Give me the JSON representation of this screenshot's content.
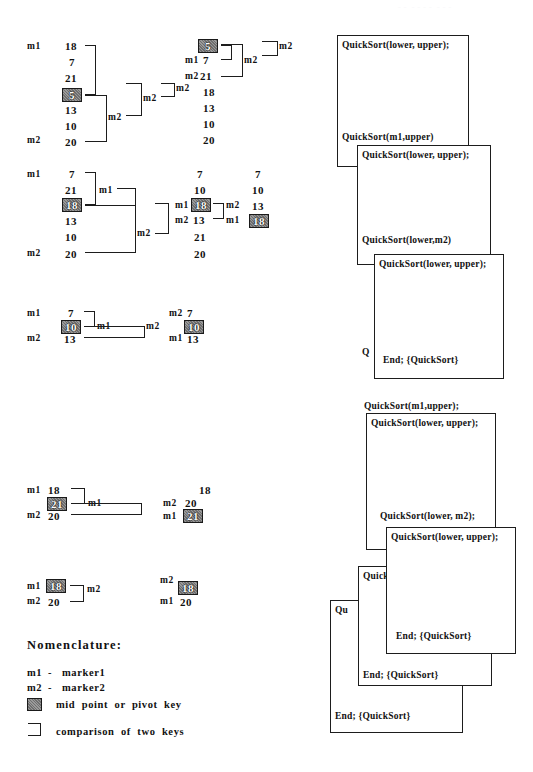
{
  "page": {
    "width": 533,
    "height": 772,
    "ink_color": "#1d1d1d",
    "pivot_fill": "#7d7d7d",
    "pivot_text_color": "#ffffff",
    "background": "#ffffff"
  },
  "markers": {
    "m1": "m1",
    "m2": "m2"
  },
  "traces": [
    {
      "id": "trace-1",
      "left": {
        "marker_top": "m1",
        "marker_bottom": "m2",
        "keys": [
          "18",
          "7",
          "21",
          "5",
          "13",
          "10",
          "20"
        ],
        "pivot_index": 3,
        "pivot_value": "5"
      },
      "bracket_labels": [
        "m2",
        "m2",
        "m2"
      ],
      "right": {
        "keys": [
          "5",
          "7",
          "21",
          "18",
          "13",
          "10",
          "20"
        ],
        "pivot_index": 0,
        "pivot_value": "5",
        "row_markers": {
          "1": "m1",
          "2": "m2"
        }
      },
      "right_bracket_labels": [
        "m2",
        "m2"
      ]
    },
    {
      "id": "trace-2",
      "left": {
        "marker_top": "m1",
        "marker_bottom": "m2",
        "keys": [
          "7",
          "21",
          "18",
          "13",
          "10",
          "20"
        ],
        "pivot_index": 2,
        "pivot_value": "18"
      },
      "bracket_labels": [
        "m1",
        "m2"
      ],
      "middle": {
        "keys": [
          "7",
          "10",
          "18",
          "13",
          "21",
          "20"
        ],
        "pivot_index": 2,
        "pivot_value": "18",
        "row_markers": {
          "2": "m1",
          "3": "m2"
        }
      },
      "middle_bracket_labels": [
        "m2",
        "m1"
      ],
      "right": {
        "keys": [
          "7",
          "10",
          "13",
          "18"
        ],
        "pivot_index": 3,
        "pivot_value": "18",
        "row_markers": {
          "2": "m2",
          "3": "m1"
        }
      }
    },
    {
      "id": "trace-3",
      "left": {
        "marker_top": "m1",
        "marker_bottom": "m2",
        "keys": [
          "7",
          "10",
          "13"
        ],
        "pivot_index": 1,
        "pivot_value": "10"
      },
      "bracket_labels": [
        "m1",
        "m2"
      ],
      "right": {
        "keys": [
          "7",
          "10",
          "13"
        ],
        "pivot_index": 1,
        "pivot_value": "10",
        "row_markers": {
          "0": "m2",
          "2": "m1"
        }
      }
    },
    {
      "id": "trace-4",
      "left": {
        "marker_top": "m1",
        "marker_bottom": "m2",
        "keys": [
          "18",
          "21",
          "20"
        ],
        "pivot_index": 1,
        "pivot_value": "21"
      },
      "bracket_labels": [
        "m1"
      ],
      "right": {
        "keys": [
          "18",
          "20",
          "21"
        ],
        "pivot_index": 2,
        "pivot_value": "21",
        "row_markers": {
          "1": "m2",
          "2": "m1"
        }
      }
    },
    {
      "id": "trace-5",
      "left": {
        "marker_top": "m1",
        "marker_bottom": "m2",
        "keys": [
          "18",
          "20"
        ],
        "pivot_index": 0,
        "pivot_value": "18"
      },
      "bracket_labels": [
        "m2"
      ],
      "right": {
        "keys": [
          "18",
          "20"
        ],
        "pivot_index": 0,
        "pivot_value": "18",
        "row_markers": {
          "0": "m2",
          "1": "m1"
        }
      }
    }
  ],
  "nomenclature": {
    "title": "Nomenclature:",
    "entries": [
      {
        "key": "m1",
        "dash": "-",
        "label": "marker1"
      },
      {
        "key": "m2",
        "dash": "-",
        "label": "marker2"
      }
    ],
    "legend_pivot": "mid  point  or  pivot  key",
    "legend_bracket": "comparison  of  two  keys"
  },
  "callstack": {
    "boxes": [
      {
        "id": "box-1",
        "top_label": "QuickSort(lower, upper);",
        "bottom_label": "QuickSort(m1,upper)"
      },
      {
        "id": "box-2",
        "top_label": "QuickSort(lower, upper);",
        "bottom_label": "QuickSort(lower,m2)"
      },
      {
        "id": "box-3",
        "top_label": "QuickSort(lower, upper);",
        "bottom_label": "End; {QuickSort}"
      },
      {
        "id": "box-4",
        "top_label": "QuickSort(lower, upper);",
        "mid_label": "QuickSort(m1,upper);",
        "bottom_label": "QuickSort(lower, m2);"
      },
      {
        "id": "box-5",
        "top_label": "QuickSort(lower, upper);",
        "bottom_label": "End; {QuickSort}"
      },
      {
        "id": "box-6",
        "top_label": "QuickSort",
        "bottom_label": "End; {QuickSort}"
      },
      {
        "id": "box-7",
        "top_label": "Qu",
        "bottom_label": "End; {QuickSort}"
      }
    ],
    "occluded_labels": {
      "b4_partial": "Q",
      "b6_partial": "Quick",
      "b7_partial": "Qu"
    }
  }
}
